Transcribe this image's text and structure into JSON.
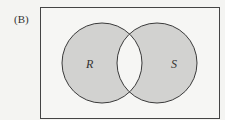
{
  "figure_label": "(B)",
  "diagram": {
    "type": "venn",
    "shading": "symmetric difference (R only and S only shaded; intersection unshaded)",
    "sets": [
      {
        "name": "R",
        "label": "R"
      },
      {
        "name": "S",
        "label": "S"
      }
    ],
    "colors": {
      "background": "#f4f4f2",
      "universe_fill": "#f6f6f4",
      "shade": "#d2d2d0",
      "stroke": "#3a3a3a"
    }
  }
}
